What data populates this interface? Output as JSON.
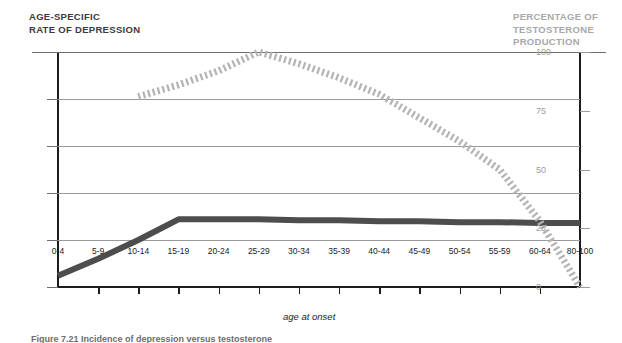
{
  "titles": {
    "left_axis": "AGE-SPECIFIC\nRATE OF DEPRESSION",
    "right_axis": "PERCENTAGE OF\nTESTOSTERONE\nPRODUCTION",
    "x_axis": "age at onset",
    "caption": "Figure 7.21 Incidence of depression versus testosterone"
  },
  "colors": {
    "depression_line": "#4d4d4d",
    "testosterone_line": "#b3b3b3",
    "axis": "#1c1c1c",
    "gridline": "#9a9a9a",
    "right_axis_text": "#9d9d9d",
    "left_title_text": "#3a3a3a",
    "right_title_text": "#a8a8a8"
  },
  "chart_data": {
    "type": "line",
    "title": "",
    "xlabel": "age at onset",
    "categories": [
      "0-4",
      "5-9",
      "10-14",
      "15-19",
      "20-24",
      "25-29",
      "30-34",
      "35-39",
      "40-44",
      "45-49",
      "50-54",
      "55-59",
      "60-64",
      "80-100"
    ],
    "grid": true,
    "legend_position": "none",
    "axes": {
      "left": {
        "label": "AGE-SPECIFIC RATE OF DEPRESSION",
        "ticks": [
          "0",
          "0.005",
          "0.01",
          "0.015",
          "0.02",
          "0.025"
        ],
        "tick_values": [
          0,
          0.005,
          0.01,
          0.015,
          0.02,
          0.025
        ],
        "ylim": [
          0,
          0.025
        ]
      },
      "right": {
        "label": "PERCENTAGE OF TESTOSTERONE PRODUCTION",
        "ticks": [
          "0",
          "25",
          "50",
          "75",
          "100"
        ],
        "tick_values": [
          0,
          25,
          50,
          75,
          100
        ],
        "ylim": [
          0,
          100
        ]
      }
    },
    "series": [
      {
        "name": "Age-specific rate of depression",
        "axis": "left",
        "style": "solid-thick",
        "color": "#4d4d4d",
        "values": [
          0.0012,
          0.003,
          0.005,
          0.0072,
          0.0072,
          0.0072,
          0.0071,
          0.0071,
          0.007,
          0.007,
          0.0069,
          0.0069,
          0.0068,
          0.0068
        ]
      },
      {
        "name": "Percentage of testosterone production",
        "axis": "right",
        "style": "dotted-thick",
        "color": "#b3b3b3",
        "values": [
          null,
          null,
          81,
          86,
          92,
          100,
          95,
          89,
          82,
          72,
          62,
          50,
          28,
          0
        ]
      }
    ]
  }
}
